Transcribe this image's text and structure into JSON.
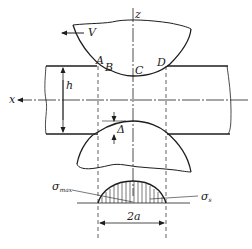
{
  "diagram": {
    "type": "rolling-contact-deformation-zone",
    "axes": {
      "x_label": "x",
      "z_label": "z"
    },
    "velocity_label": "V",
    "points": [
      "A",
      "B",
      "C",
      "D"
    ],
    "strip_thickness_label": "h",
    "compression_label": "Δ",
    "stress_max_label": "σ",
    "stress_max_sub": "max",
    "stress_s_label": "σ",
    "stress_s_sub": "s",
    "contact_width_label": "2a",
    "colors": {
      "line": "#1e1e1e",
      "background": "#ffffff"
    }
  }
}
